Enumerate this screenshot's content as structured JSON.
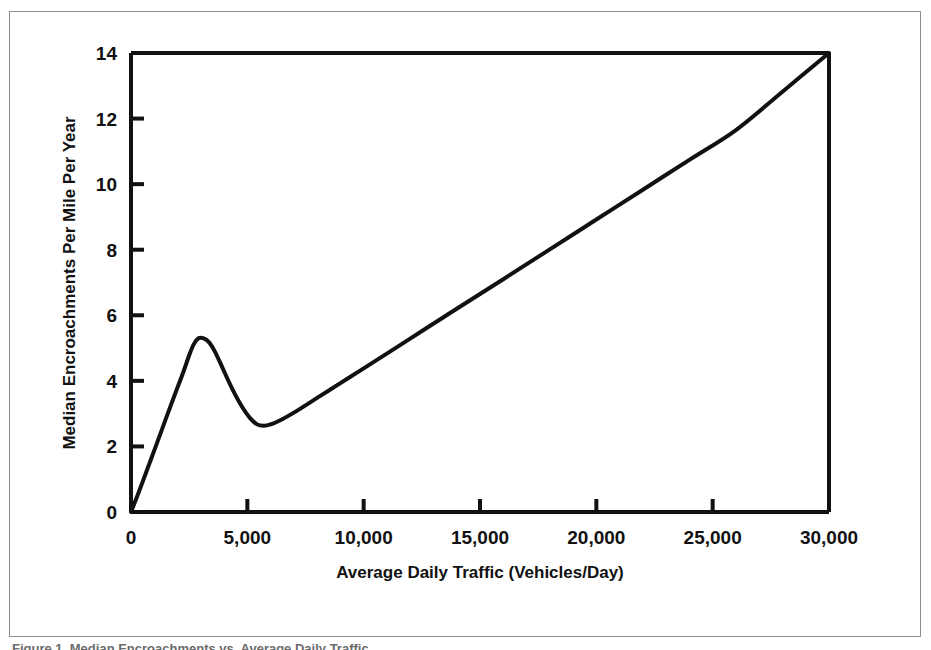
{
  "figure": {
    "caption": "Figure 1. Median Encroachments vs. Average Daily Traffic.",
    "frame_color": "#8d8d8d",
    "background_color": "#ffffff"
  },
  "chart_data": {
    "type": "line",
    "title": "",
    "subtitle": "",
    "xlabel": "Average Daily Traffic (Vehicles/Day)",
    "ylabel": "Median Encroachments Per Mile Per Year",
    "xlim": [
      0,
      30000
    ],
    "ylim": [
      0,
      14
    ],
    "xticks": [
      0,
      5000,
      10000,
      15000,
      20000,
      25000,
      30000
    ],
    "xticklabels": [
      "0",
      "5,000",
      "10,000",
      "15,000",
      "20,000",
      "25,000",
      "30,000"
    ],
    "yticks": [
      0,
      2,
      4,
      6,
      8,
      10,
      12,
      14
    ],
    "yticklabels": [
      "0",
      "2",
      "4",
      "6",
      "8",
      "10",
      "12",
      "14"
    ],
    "grid": false,
    "legend": null,
    "legend_position": "none",
    "annotations": [],
    "line_color": "#111111",
    "line_width": 4,
    "series": [
      {
        "name": "Median encroachments per mile per year",
        "x": [
          0,
          250,
          500,
          750,
          1000,
          1250,
          1500,
          1750,
          2000,
          2250,
          2500,
          2700,
          2900,
          3100,
          3350,
          3600,
          3900,
          4200,
          4500,
          4800,
          5100,
          5400,
          5700,
          6000,
          6500,
          7000,
          8000,
          9000,
          10000,
          12000,
          14000,
          16000,
          18000,
          20000,
          22000,
          24000,
          26000,
          28000,
          30000
        ],
        "y": [
          0.0,
          0.45,
          0.92,
          1.4,
          1.88,
          2.36,
          2.85,
          3.33,
          3.8,
          4.27,
          4.78,
          5.12,
          5.3,
          5.3,
          5.18,
          4.9,
          4.45,
          3.98,
          3.55,
          3.18,
          2.88,
          2.68,
          2.63,
          2.67,
          2.83,
          3.03,
          3.48,
          3.93,
          4.38,
          5.29,
          6.2,
          7.1,
          8.01,
          8.92,
          9.83,
          10.74,
          11.65,
          12.82,
          14.0
        ]
      }
    ]
  },
  "plot_geometry": {
    "left": 131,
    "right": 829,
    "top": 53,
    "bottom": 512
  }
}
